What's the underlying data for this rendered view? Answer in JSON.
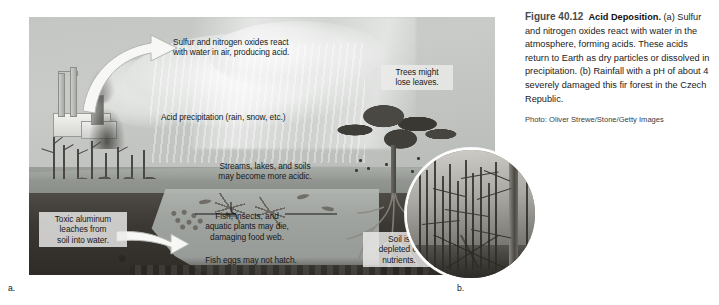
{
  "figure": {
    "number": "Figure 40.12",
    "title": "Acid Deposition.",
    "caption_a": " (a) Sulfur and nitrogen oxides react with water in the atmosphere, forming acids. These acids return to Earth as dry particles or dissolved in precipitation. (b) Rainfall with a pH of about 4 severely damaged this fir forest in the Czech Republic.",
    "credit": "Photo: Oliver Strewe/Stone/Getty Images",
    "panel_a_letter": "a.",
    "panel_b_letter": "b."
  },
  "diagram": {
    "labels": {
      "sulfur": "Sulfur and nitrogen oxides react\nwith water in air, producing acid.",
      "acid_precipitation": "Acid precipitation (rain, snow, etc.)",
      "streams": "Streams, lakes, and soils\nmay become more acidic.",
      "trees": "Trees might\nlose leaves.",
      "toxic_aluminum": "Toxic aluminum\nleaches from\nsoil into water.",
      "fish": "Fish, insects, and\naquatic plants may die,\ndamaging food web.",
      "fish_eggs": "Fish eggs may not hatch.",
      "soil_depleted": "Soil is\ndepleted of\nnutrients."
    },
    "scene_elements": [
      "factory-with-smokestacks",
      "smoke-plume",
      "dead-trees",
      "cloud",
      "rain-streaks",
      "deciduous-tree-losing-leaves",
      "lake-cross-section",
      "soil-cross-section",
      "tree-roots",
      "fish-silhouettes",
      "fish-eggs"
    ]
  },
  "photo_b": {
    "description": "Damaged fir forest with bare dead trunks",
    "shape": "circle"
  },
  "colors": {
    "page_background": "#ffffff",
    "illustration_sky": "#c3c6c3",
    "soil": "#3b3833",
    "label_background": "#ececea",
    "text": "#17181a",
    "fignum": "#4a4a4a"
  }
}
